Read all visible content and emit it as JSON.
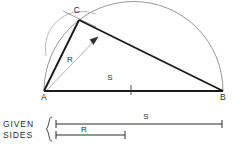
{
  "figure": {
    "colors": {
      "ink": "#2b2b2b",
      "heavy_line": "#1a1a1a",
      "light_line": "#8a8a8a",
      "background": "#ffffff"
    },
    "vertices": [
      {
        "name": "A",
        "label": "A",
        "x": 44,
        "y": 91,
        "label_x": 44,
        "label_y": 100
      },
      {
        "name": "B",
        "label": "B",
        "x": 223,
        "y": 91,
        "label_x": 223,
        "label_y": 100
      },
      {
        "name": "C",
        "label": "C",
        "x": 79,
        "y": 20,
        "label_x": 77,
        "label_y": 13
      }
    ],
    "dimension_labels": [
      {
        "name": "radius-label-triangle",
        "text": "R",
        "x": 70,
        "y": 62
      },
      {
        "name": "side-label-triangle",
        "text": "S",
        "x": 110,
        "y": 80
      },
      {
        "name": "side-label-given",
        "text": "S",
        "x": 146,
        "y": 118
      },
      {
        "name": "radius-label-given",
        "text": "R",
        "x": 84,
        "y": 131
      }
    ],
    "legend": {
      "line1": "GIVEN",
      "line2": "SIDES",
      "brace": "{",
      "given_side_S": {
        "x1": 56,
        "x2": 222,
        "y": 124
      },
      "given_side_R": {
        "x1": 56,
        "x2": 125,
        "y": 135
      }
    },
    "semicircle": {
      "center_x": 133.5,
      "center_y": 91,
      "radius": 89.5
    },
    "base_tick_x": 131
  }
}
